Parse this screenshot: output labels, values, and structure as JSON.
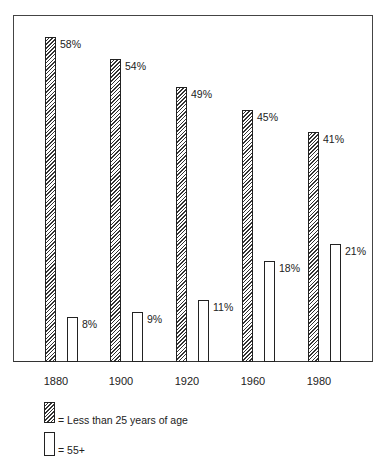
{
  "chart_data": {
    "type": "bar",
    "title": "",
    "xlabel": "",
    "ylabel": "",
    "categories": [
      "1880",
      "1900",
      "1920",
      "1960",
      "1980"
    ],
    "series": [
      {
        "name": "Less than 25 years of age",
        "pattern": "hatched",
        "values": [
          58,
          54,
          49,
          45,
          41
        ],
        "labels": [
          "58%",
          "54%",
          "49%",
          "45%",
          "41%"
        ]
      },
      {
        "name": "55+",
        "pattern": "open",
        "values": [
          8,
          9,
          11,
          18,
          21
        ],
        "labels": [
          "8%",
          "9%",
          "11%",
          "18%",
          "21%"
        ]
      }
    ],
    "ylim": [
      0,
      62
    ],
    "grid": false,
    "legend_position": "bottom-left",
    "value_format": "percent"
  },
  "legend": {
    "items": [
      {
        "symbol": "=",
        "label": "= Less than 25 years of age"
      },
      {
        "symbol": "=",
        "label": "= 55+"
      }
    ]
  },
  "colors": {
    "ink": "#222222",
    "background": "#ffffff"
  }
}
